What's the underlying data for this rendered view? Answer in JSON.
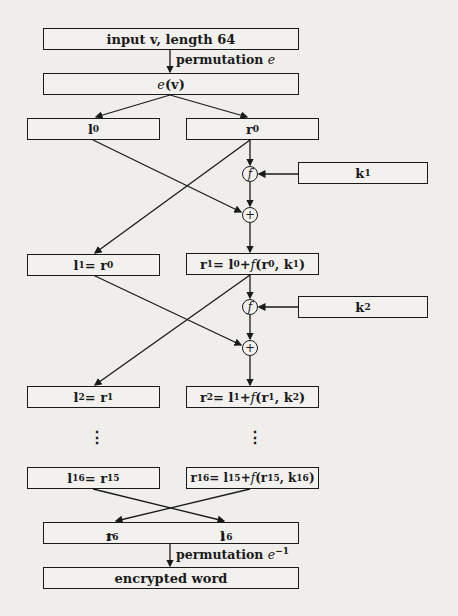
{
  "diagram": {
    "input_box": {
      "text": "input v, length 64"
    },
    "perm_label": {
      "prefix": "permutation ",
      "symbol": "e"
    },
    "ev_box": {
      "func": "e",
      "arg": "(v)"
    },
    "round0": {
      "left": {
        "var": "l",
        "sub": "0"
      },
      "right": {
        "var": "r",
        "sub": "0"
      }
    },
    "key1": {
      "var": "k",
      "sub": "1"
    },
    "key2": {
      "var": "k",
      "sub": "2"
    },
    "f_node": "f",
    "xor_node": "+",
    "round1": {
      "left": {
        "text": "l",
        "sub": "1",
        "eq": " = r",
        "eqsub": "0"
      },
      "right": {
        "pre": "r",
        "presub": "1",
        "mid": " = l",
        "midsub": "0",
        "plus": " + ",
        "f": "f",
        "open": "(r",
        "argsub": "0",
        "comma": ", k",
        "ksub": "1",
        "close": ")"
      }
    },
    "round2": {
      "left": {
        "text": "l",
        "sub": "2",
        "eq": " = r",
        "eqsub": "1"
      },
      "right": {
        "pre": "r",
        "presub": "2",
        "mid": " = l",
        "midsub": "1",
        "plus": " + ",
        "f": "f",
        "open": "(r",
        "argsub": "1",
        "comma": ", k",
        "ksub": "2",
        "close": ")"
      }
    },
    "ellipsis": "⋮",
    "round16": {
      "left": {
        "text": "l",
        "sub": "16",
        "eq": " = r",
        "eqsub": "15"
      },
      "right": {
        "pre": "r",
        "presub": "16",
        "mid": " = l",
        "midsub": "15",
        "plus": " + ",
        "f": "f",
        "open": "(r",
        "argsub": "15",
        "comma": ", k",
        "ksub": "16",
        "close": ")"
      }
    },
    "swap_box": {
      "left": {
        "var": "r",
        "sub": "16"
      },
      "right": {
        "var": "l",
        "sub": "16"
      }
    },
    "inv_perm_label": {
      "prefix": "permutation ",
      "symbol": "e",
      "exp": "−1"
    },
    "output_box": {
      "text": "encrypted word"
    }
  }
}
